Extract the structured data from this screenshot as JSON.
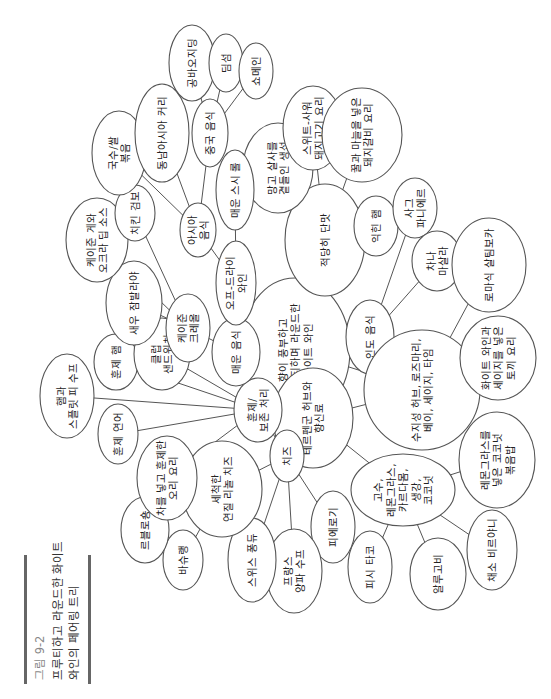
{
  "caption": {
    "figure_label": "그림 9-2",
    "title_lines": [
      "프루티하고 라운드한 화이트",
      "와인의 페어링 트리"
    ],
    "colors": {
      "label": "#888888",
      "title": "#333333",
      "bar": "#666666"
    }
  },
  "orientation": "rotated -90 degrees (text reads bottom-to-top)",
  "root": {
    "id": "root",
    "lines": [
      "향이 풍부하고",
      "프루티하며 라운드한",
      "화이트 와인"
    ]
  },
  "nodes": [
    {
      "id": "root",
      "lines": [
        "향이 풍부하고",
        "프루티하며 라운드한",
        "화이트 와인"
      ],
      "x": 295,
      "y": 350,
      "rx": 55,
      "ry": 72
    },
    {
      "id": "indian",
      "lines": [
        "인도 음식"
      ],
      "x": 370,
      "y": 337,
      "rx": 24,
      "ry": 37
    },
    {
      "id": "sweet",
      "lines": [
        "적당히 단맛"
      ],
      "x": 325,
      "y": 240,
      "rx": 40,
      "ry": 56
    },
    {
      "id": "mango-fish",
      "lines": [
        "망고 살사를",
        "곁들인 생선"
      ],
      "x": 278,
      "y": 168,
      "rx": 35,
      "ry": 45
    },
    {
      "id": "sweet-sour-pork",
      "lines": [
        "스위트-사워",
        "돼지고기 요리"
      ],
      "x": 313,
      "y": 128,
      "rx": 30,
      "ry": 42
    },
    {
      "id": "honey-ribs",
      "lines": [
        "꿀과 마늘을 넣은",
        "돼지갈비 요리"
      ],
      "x": 362,
      "y": 135,
      "rx": 40,
      "ry": 47
    },
    {
      "id": "cooked-ham",
      "lines": [
        "익힌 햄"
      ],
      "x": 376,
      "y": 226,
      "rx": 22,
      "ry": 30
    },
    {
      "id": "saag-paneer",
      "lines": [
        "사그",
        "파니에르"
      ],
      "x": 415,
      "y": 208,
      "rx": 22,
      "ry": 30
    },
    {
      "id": "chana-masala",
      "lines": [
        "차나",
        "마살라"
      ],
      "x": 437,
      "y": 261,
      "rx": 25,
      "ry": 30
    },
    {
      "id": "saltimbocca",
      "lines": [
        "로마식 살팀보카"
      ],
      "x": 489,
      "y": 265,
      "rx": 37,
      "ry": 47
    },
    {
      "id": "resin-herbs",
      "lines": [
        "수지성 허브, 로즈마리,",
        "베이, 세이지, 타임"
      ],
      "x": 422,
      "y": 390,
      "rx": 58,
      "ry": 60
    },
    {
      "id": "rabbit",
      "lines": [
        "화이트 와인과",
        "세이지를 넣은",
        "토끼 요리"
      ],
      "x": 498,
      "y": 358,
      "rx": 38,
      "ry": 42
    },
    {
      "id": "terpene",
      "lines": [
        "테르펜군 허브와",
        "향신료"
      ],
      "x": 313,
      "y": 418,
      "rx": 40,
      "ry": 50
    },
    {
      "id": "cilantro",
      "lines": [
        "고수,",
        "레몬그라스,",
        "카르다몸,",
        "생강,",
        "코코넛"
      ],
      "x": 403,
      "y": 490,
      "rx": 52,
      "ry": 36
    },
    {
      "id": "coconut-rice",
      "lines": [
        "레몬그라스를",
        "넣은 코코넛",
        "볶음밥"
      ],
      "x": 497,
      "y": 460,
      "rx": 38,
      "ry": 48
    },
    {
      "id": "fish-taco",
      "lines": [
        "피시 타코"
      ],
      "x": 370,
      "y": 567,
      "rx": 22,
      "ry": 36
    },
    {
      "id": "aloo-gobi",
      "lines": [
        "알루고비"
      ],
      "x": 438,
      "y": 574,
      "rx": 28,
      "ry": 36
    },
    {
      "id": "biryani",
      "lines": [
        "채소 비르야니"
      ],
      "x": 492,
      "y": 550,
      "rx": 25,
      "ry": 40
    },
    {
      "id": "pierogi",
      "lines": [
        "피에로기"
      ],
      "x": 333,
      "y": 527,
      "rx": 22,
      "ry": 36
    },
    {
      "id": "cheese",
      "lines": [
        "치즈"
      ],
      "x": 287,
      "y": 456,
      "rx": 17,
      "ry": 26
    },
    {
      "id": "onion-soup",
      "lines": [
        "프랑스",
        "양파 수프"
      ],
      "x": 294,
      "y": 571,
      "rx": 28,
      "ry": 42
    },
    {
      "id": "fondue",
      "lines": [
        "스위스 퐁듀"
      ],
      "x": 252,
      "y": 560,
      "rx": 24,
      "ry": 42
    },
    {
      "id": "washed-rind",
      "lines": [
        "세척한",
        "연질 리놀 치즈"
      ],
      "x": 222,
      "y": 489,
      "rx": 40,
      "ry": 48
    },
    {
      "id": "vacherin",
      "lines": [
        "바슈랭"
      ],
      "x": 183,
      "y": 560,
      "rx": 20,
      "ry": 30
    },
    {
      "id": "reblochon",
      "lines": [
        "르블로숑"
      ],
      "x": 145,
      "y": 530,
      "rx": 24,
      "ry": 33
    },
    {
      "id": "smoked",
      "lines": [
        "훈제/",
        "보존 처리"
      ],
      "x": 258,
      "y": 410,
      "rx": 24,
      "ry": 32
    },
    {
      "id": "tea-duck",
      "lines": [
        "차를 넣고 훈제한",
        "오리 요리"
      ],
      "x": 167,
      "y": 478,
      "rx": 30,
      "ry": 42
    },
    {
      "id": "smoked-salmon",
      "lines": [
        "훈제 연어"
      ],
      "x": 118,
      "y": 434,
      "rx": 20,
      "ry": 30
    },
    {
      "id": "pea-soup",
      "lines": [
        "햄과",
        "스플릿 피 수프"
      ],
      "x": 67,
      "y": 396,
      "rx": 27,
      "ry": 42
    },
    {
      "id": "smoked-ham",
      "lines": [
        "훈제 햄"
      ],
      "x": 116,
      "y": 362,
      "rx": 22,
      "ry": 28
    },
    {
      "id": "club",
      "lines": [
        "클럽",
        "샌드위치"
      ],
      "x": 162,
      "y": 354,
      "rx": 28,
      "ry": 36
    },
    {
      "id": "spicy",
      "lines": [
        "매운 음식"
      ],
      "x": 236,
      "y": 352,
      "rx": 24,
      "ry": 34
    },
    {
      "id": "cajun",
      "lines": [
        "케이준",
        "크레올"
      ],
      "x": 188,
      "y": 328,
      "rx": 22,
      "ry": 34
    },
    {
      "id": "jambalaya",
      "lines": [
        "새우 잠발라야"
      ],
      "x": 134,
      "y": 303,
      "rx": 28,
      "ry": 42
    },
    {
      "id": "off-dry",
      "lines": [
        "오프-드라이",
        "와인"
      ],
      "x": 236,
      "y": 283,
      "rx": 20,
      "ry": 42
    },
    {
      "id": "sushi",
      "lines": [
        "매운 스시 롤"
      ],
      "x": 235,
      "y": 190,
      "rx": 19,
      "ry": 40
    },
    {
      "id": "asian",
      "lines": [
        "아시아",
        "음식"
      ],
      "x": 198,
      "y": 230,
      "rx": 18,
      "ry": 27
    },
    {
      "id": "crab-dip",
      "lines": [
        "케이준 게와",
        "오크라 딥 소스"
      ],
      "x": 97,
      "y": 240,
      "rx": 31,
      "ry": 42
    },
    {
      "id": "gumbo",
      "lines": [
        "치킨 검보"
      ],
      "x": 135,
      "y": 213,
      "rx": 20,
      "ry": 28
    },
    {
      "id": "noodles",
      "lines": [
        "국수/쌀",
        "볶음"
      ],
      "x": 119,
      "y": 153,
      "rx": 27,
      "ry": 42
    },
    {
      "id": "curry",
      "lines": [
        "동남아시아 커리"
      ],
      "x": 162,
      "y": 133,
      "rx": 27,
      "ry": 49
    },
    {
      "id": "chinese",
      "lines": [
        "중국 음식"
      ],
      "x": 210,
      "y": 133,
      "rx": 18,
      "ry": 34
    },
    {
      "id": "kungpao",
      "lines": [
        "공바오지딩"
      ],
      "x": 192,
      "y": 63,
      "rx": 23,
      "ry": 38
    },
    {
      "id": "dimsum",
      "lines": [
        "딤섬"
      ],
      "x": 226,
      "y": 63,
      "rx": 17,
      "ry": 29
    },
    {
      "id": "chowmein",
      "lines": [
        "쇼메인"
      ],
      "x": 256,
      "y": 71,
      "rx": 17,
      "ry": 28
    }
  ],
  "edges": [
    [
      "root",
      "indian"
    ],
    [
      "root",
      "sweet"
    ],
    [
      "root",
      "resin-herbs"
    ],
    [
      "root",
      "terpene"
    ],
    [
      "root",
      "spicy"
    ],
    [
      "root",
      "smoked"
    ],
    [
      "root",
      "off-dry"
    ],
    [
      "indian",
      "saag-paneer"
    ],
    [
      "indian",
      "chana-masala"
    ],
    [
      "sweet",
      "mango-fish"
    ],
    [
      "sweet",
      "sweet-sour-pork"
    ],
    [
      "sweet",
      "honey-ribs"
    ],
    [
      "sweet",
      "cooked-ham"
    ],
    [
      "resin-herbs",
      "saltimbocca"
    ],
    [
      "resin-herbs",
      "rabbit"
    ],
    [
      "resin-herbs",
      "terpene"
    ],
    [
      "terpene",
      "cilantro"
    ],
    [
      "cilantro",
      "coconut-rice"
    ],
    [
      "cilantro",
      "fish-taco"
    ],
    [
      "cilantro",
      "aloo-gobi"
    ],
    [
      "cilantro",
      "biryani"
    ],
    [
      "smoked",
      "cheese"
    ],
    [
      "smoked",
      "tea-duck"
    ],
    [
      "smoked",
      "smoked-salmon"
    ],
    [
      "smoked",
      "pea-soup"
    ],
    [
      "smoked",
      "smoked-ham"
    ],
    [
      "smoked",
      "club"
    ],
    [
      "cheese",
      "pierogi"
    ],
    [
      "cheese",
      "onion-soup"
    ],
    [
      "cheese",
      "fondue"
    ],
    [
      "cheese",
      "washed-rind"
    ],
    [
      "washed-rind",
      "vacherin"
    ],
    [
      "washed-rind",
      "reblochon"
    ],
    [
      "spicy",
      "cajun"
    ],
    [
      "spicy",
      "off-dry"
    ],
    [
      "cajun",
      "jambalaya"
    ],
    [
      "cajun",
      "crab-dip"
    ],
    [
      "cajun",
      "gumbo"
    ],
    [
      "off-dry",
      "asian"
    ],
    [
      "off-dry",
      "sushi"
    ],
    [
      "asian",
      "noodles"
    ],
    [
      "asian",
      "curry"
    ],
    [
      "asian",
      "chinese"
    ],
    [
      "chinese",
      "kungpao"
    ],
    [
      "chinese",
      "dimsum"
    ],
    [
      "chinese",
      "chowmein"
    ]
  ]
}
